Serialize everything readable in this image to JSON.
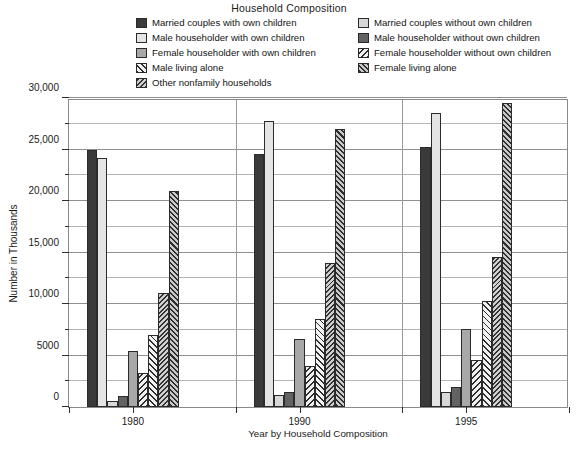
{
  "chart_data": {
    "type": "bar",
    "title": "Household Composition",
    "xlabel": "Year by Household Composition",
    "ylabel": "Number in Thousands",
    "categories": [
      "1980",
      "1990",
      "1995"
    ],
    "ylim": [
      0,
      30000
    ],
    "yticks": [
      0,
      5000,
      10000,
      15000,
      20000,
      25000,
      30000
    ],
    "ytick_labels": [
      "0",
      "5000",
      "10,000",
      "15,000",
      "20,000",
      "25,000",
      "30,000"
    ],
    "minor_tick_step": 2500,
    "grid": true,
    "legend_position": "top",
    "series": [
      {
        "name": "Married couples with own children",
        "fill": "solid-dark",
        "values": [
          24961,
          24537,
          25241
        ]
      },
      {
        "name": "Married couples without own children",
        "fill": "solid-white",
        "values": [
          24151,
          27780,
          28526
        ]
      },
      {
        "name": "Male householder with own children",
        "fill": "solid-light",
        "values": [
          616,
          1153,
          1440
        ]
      },
      {
        "name": "Male householder without own children",
        "fill": "solid-gray",
        "values": [
          1117,
          1442,
          1975
        ]
      },
      {
        "name": "Female householder with own children",
        "fill": "solid-mid",
        "values": [
          5445,
          6599,
          7615
        ]
      },
      {
        "name": "Female householder without own children",
        "fill": "diag-nw",
        "values": [
          3261,
          3976,
          4531
        ]
      },
      {
        "name": "Male living alone",
        "fill": "diag-ne",
        "values": [
          6966,
          8586,
          10258
        ]
      },
      {
        "name": "Other nonfamily households",
        "fill": "diag-dense-nw",
        "values": [
          11027,
          13962,
          14517
        ]
      },
      {
        "name": "Female living alone",
        "fill": "diag-dense-ne",
        "values": [
          20988,
          27039,
          29484
        ]
      }
    ]
  },
  "legend": {
    "columns": [
      {
        "items": [
          {
            "label": "Married couples with own children",
            "swatch": "solid-dark"
          },
          {
            "label": "Male householder with own children",
            "swatch": "solid-white"
          },
          {
            "label": "Female householder with own children",
            "swatch": "solid-mid"
          },
          {
            "label": "Male living alone",
            "swatch": "diag-ne"
          },
          {
            "label": "Other nonfamily households",
            "swatch": "diag-dense-nw"
          }
        ]
      },
      {
        "items": [
          {
            "label": "Married couples without own children",
            "swatch": "solid-light"
          },
          {
            "label": "Male householder without own children",
            "swatch": "solid-gray"
          },
          {
            "label": "Female householder without own children",
            "swatch": "diag-nw"
          },
          {
            "label": "Female living alone",
            "swatch": "diag-dense-ne"
          }
        ]
      }
    ]
  },
  "colors": {
    "axis": "#2e2e2e",
    "grid": "#9a9a9a",
    "frame": "#8a8a8a",
    "text": "#1a1a1a"
  }
}
